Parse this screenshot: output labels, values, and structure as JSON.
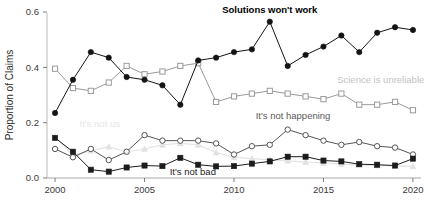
{
  "chart_data": {
    "type": "line",
    "title": "",
    "subtitle": "",
    "xlabel": "",
    "ylabel": "Proportion of Claims",
    "xlim": [
      1999.5,
      2020.5
    ],
    "ylim": [
      0.0,
      0.62
    ],
    "grid": false,
    "legend_position": "inline-annotations",
    "x": [
      2000,
      2001,
      2002,
      2003,
      2004,
      2005,
      2006,
      2007,
      2008,
      2009,
      2010,
      2011,
      2012,
      2013,
      2014,
      2015,
      2016,
      2017,
      2018,
      2019,
      2020
    ],
    "xticks": [
      2000,
      2005,
      2010,
      2015,
      2020
    ],
    "xticklabels": [
      "2000",
      "2005",
      "2010",
      "2015",
      "2020"
    ],
    "yticks": [
      0.0,
      0.2,
      0.4,
      0.6
    ],
    "yticklabels": [
      "0.0",
      "0.2",
      "0.4",
      "0.6"
    ],
    "series": [
      {
        "name": "Solutions won't work",
        "color": "#141414",
        "marker": "filled-circle",
        "label_color": "#000000",
        "values": [
          0.235,
          0.355,
          0.455,
          0.435,
          0.365,
          0.355,
          0.335,
          0.265,
          0.425,
          0.435,
          0.455,
          0.465,
          0.565,
          0.405,
          0.445,
          0.475,
          0.515,
          0.455,
          0.525,
          0.545,
          0.535
        ]
      },
      {
        "name": "Science is unreliable",
        "color": "#9a9a9a",
        "marker": "open-square",
        "label_color": "#c2c2c2",
        "values": [
          0.395,
          0.325,
          0.315,
          0.345,
          0.405,
          0.375,
          0.385,
          0.405,
          0.415,
          0.275,
          0.295,
          0.305,
          0.315,
          0.305,
          0.295,
          0.285,
          0.305,
          0.265,
          0.265,
          0.275,
          0.245
        ]
      },
      {
        "name": "It's not happening",
        "color": "#555555",
        "marker": "open-circle",
        "label_color": "#5a5a5a",
        "values": [
          0.105,
          0.075,
          0.105,
          0.065,
          0.095,
          0.155,
          0.135,
          0.135,
          0.135,
          0.125,
          0.085,
          0.115,
          0.12,
          0.175,
          0.155,
          0.135,
          0.12,
          0.13,
          0.115,
          0.11,
          0.085
        ]
      },
      {
        "name": "It's not bad",
        "color": "#1c1c1c",
        "marker": "filled-square",
        "label_color": "#1c1c1c",
        "values": [
          0.145,
          0.095,
          0.03,
          0.023,
          0.038,
          0.045,
          0.043,
          0.073,
          0.048,
          0.042,
          0.043,
          0.052,
          0.06,
          0.077,
          0.077,
          0.063,
          0.06,
          0.05,
          0.048,
          0.045,
          0.07
        ]
      },
      {
        "name": "It's not us",
        "color": "#e2e2e2",
        "marker": "filled-triangle",
        "label_color": "#e6e6e6",
        "values": [
          0.15,
          0.082,
          0.098,
          0.113,
          0.095,
          0.105,
          0.12,
          0.125,
          0.12,
          0.092,
          0.075,
          0.07,
          0.066,
          0.062,
          0.058,
          0.054,
          0.05,
          0.047,
          0.045,
          0.044,
          0.042
        ]
      }
    ],
    "annotations": [
      {
        "text": "Solutions won't work",
        "x": 2012,
        "y": 0.595,
        "series": "Solutions won't work"
      },
      {
        "text": "Science is unreliable",
        "x": 2018.2,
        "y": 0.345,
        "series": "Science is unreliable"
      },
      {
        "text": "It's not happening",
        "x": 2013.3,
        "y": 0.215,
        "series": "It's not happening"
      },
      {
        "text": "It's not bad",
        "x": 2007.7,
        "y": 0.012,
        "series": "It's not bad"
      },
      {
        "text": "It's not us",
        "x": 2002.5,
        "y": 0.185,
        "series": "It's not us"
      }
    ]
  }
}
